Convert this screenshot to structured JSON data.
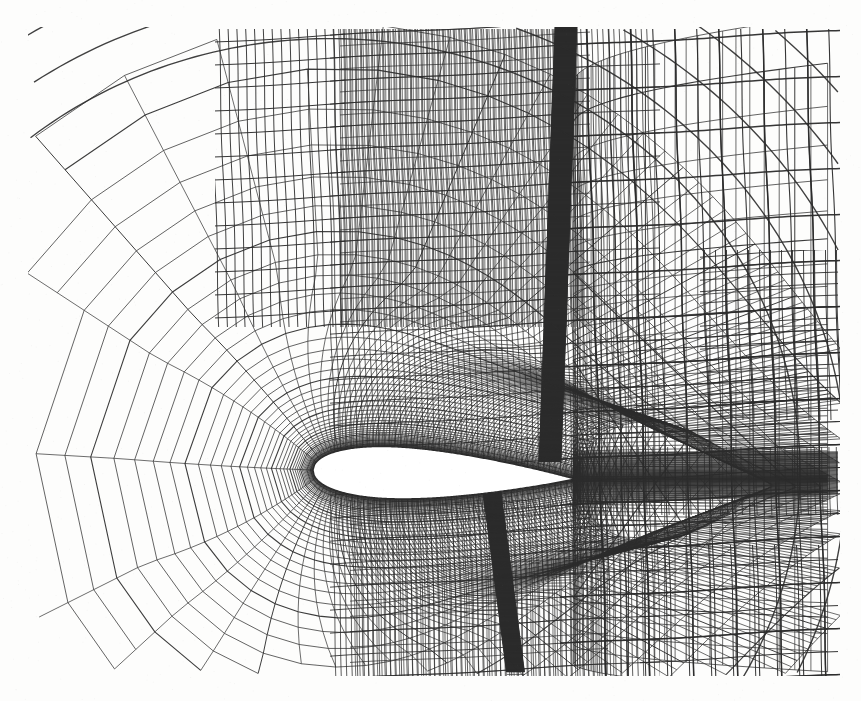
{
  "figure": {
    "kind": "cfd-mesh-plot",
    "caption_text": "",
    "background_color": "#fdfdfc",
    "line_color": "#2b2b2b",
    "body_fill_color": "#ffffff",
    "canvas_width": 861,
    "canvas_height": 701
  },
  "frame": {
    "mesh_left": 28,
    "mesh_right": 840,
    "mesh_top": 27,
    "mesh_bottom": 676
  },
  "airfoil": {
    "name": "airfoil-section",
    "leading_edge_x": 313,
    "leading_edge_y": 470,
    "trailing_edge_x": 573,
    "trailing_edge_y": 479,
    "chord_px": 260,
    "max_thickness_px": 26,
    "max_thickness_station": 0.32,
    "angle_of_attack_deg": -2.0
  },
  "ogrid": {
    "center_x": 330,
    "center_y": 471,
    "radial_rings": 46,
    "angular_lines": 180,
    "inner_radius": 14,
    "outer_radius": 430,
    "stretch_ratio": 1.115
  },
  "wake_block": {
    "name": "wake-refinement-band",
    "x_start": 573,
    "x_end": 840,
    "y_center": 481,
    "half_height": 26,
    "horizontal_line_count": 52
  },
  "shock_bands": [
    {
      "name": "upper-shock-refinement-band",
      "x_top": 566,
      "x_bottom": 550,
      "y_top": 27,
      "y_bottom": 462,
      "width": 22,
      "density": 120
    },
    {
      "name": "lower-shock-refinement-band",
      "x_top": 492,
      "x_bottom": 516,
      "y_top": 492,
      "y_bottom": 676,
      "width": 18,
      "density": 90
    }
  ],
  "refinement_blocks": [
    {
      "name": "far-upper-right-coarse",
      "x": 660,
      "y": 27,
      "w": 180,
      "h": 190,
      "level": 0
    },
    {
      "name": "upper-right-mid",
      "x": 640,
      "y": 217,
      "w": 200,
      "h": 120,
      "level": 1
    },
    {
      "name": "right-mid-refined",
      "x": 700,
      "y": 280,
      "w": 140,
      "h": 130,
      "level": 2
    },
    {
      "name": "right-lower-refined",
      "x": 640,
      "y": 540,
      "w": 200,
      "h": 136,
      "level": 1
    },
    {
      "name": "dense-shock-core",
      "x": 330,
      "y": 27,
      "w": 240,
      "h": 300,
      "level": 4
    }
  ],
  "outer_grid": {
    "name": "coarse-cartesian-outer-grid",
    "vertical_spacing": 44,
    "horizontal_spacing": 46,
    "skew_deg": 4
  },
  "legend": {
    "visible": false,
    "entries": []
  },
  "axes": {
    "visible": false,
    "x_label": "",
    "y_label": "",
    "tick_labels": []
  },
  "chart_data": {
    "type": "mesh",
    "title": "",
    "xlabel": "",
    "ylabel": "",
    "description": "Adaptively refined structured C-grid / O-grid computational mesh around a symmetric airfoil section, with strong clustering in the boundary layer, an upper-surface shock refinement band, a lower-surface shock band, and a wake refinement strip extending to the downstream boundary. The far field uses a coarse quasi-Cartesian grid with hanging-node (quadtree) subdivisions.",
    "grid": true,
    "legend_position": "none",
    "series": [
      {
        "name": "airfoil-surface",
        "x": [
          0.0,
          0.005,
          0.0125,
          0.025,
          0.05,
          0.075,
          0.1,
          0.15,
          0.2,
          0.25,
          0.3,
          0.35,
          0.4,
          0.45,
          0.5,
          0.55,
          0.6,
          0.65,
          0.7,
          0.75,
          0.8,
          0.85,
          0.9,
          0.95,
          1.0
        ],
        "y_upper": [
          0.0,
          0.0126,
          0.0197,
          0.0272,
          0.0366,
          0.0428,
          0.0473,
          0.0534,
          0.0566,
          0.058,
          0.058,
          0.0569,
          0.0548,
          0.0519,
          0.0483,
          0.0442,
          0.0397,
          0.0349,
          0.0299,
          0.0248,
          0.0196,
          0.0144,
          0.0093,
          0.0045,
          0.0
        ],
        "y_lower": [
          0.0,
          -0.0126,
          -0.0197,
          -0.0272,
          -0.0366,
          -0.0428,
          -0.0473,
          -0.0534,
          -0.0566,
          -0.058,
          -0.058,
          -0.0569,
          -0.0548,
          -0.0519,
          -0.0483,
          -0.0442,
          -0.0397,
          -0.0349,
          -0.0299,
          -0.0248,
          -0.0196,
          -0.0144,
          -0.0093,
          -0.0045,
          0.0
        ]
      }
    ],
    "annotations": [
      {
        "label": "upper shock refinement",
        "x": 0.95,
        "y": 0.9
      },
      {
        "label": "lower shock refinement",
        "x": 0.7,
        "y": -0.6
      },
      {
        "label": "wake refinement",
        "x": 1.8,
        "y": 0.0
      }
    ]
  }
}
